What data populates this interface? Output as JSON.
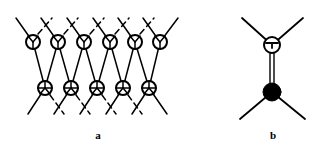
{
  "figure": {
    "background_color": "#ffffff",
    "stroke_color": "#000000",
    "width": 333,
    "height": 149,
    "panels": [
      {
        "id": "panel-a",
        "caption": "a",
        "caption_position": {
          "x": 88,
          "y": 130
        },
        "description": "Lattice of interconnected open-circle vertices and crossed-circle vertices forming a two-row diagram network",
        "top_row": {
          "vertex_type": "open-circle-y-vertex",
          "vertex_fill": "#ffffff",
          "count": 6,
          "radius": 7,
          "y": 42,
          "x_positions": [
            33,
            58,
            84,
            110,
            135,
            160
          ]
        },
        "bottom_row": {
          "vertex_type": "crossed-circle-vertex",
          "vertex_fill": "#ffffff",
          "count": 5,
          "radius": 7,
          "y": 88,
          "x_positions": [
            45,
            71,
            97,
            123,
            149
          ]
        },
        "top_legs": {
          "description": "external legs rising from each top vertex",
          "solid": [
            {
              "x1": 33,
              "y1": 42,
              "x2": 16,
              "y2": 18
            },
            {
              "x1": 58,
              "y1": 42,
              "x2": 41,
              "y2": 18
            },
            {
              "x1": 84,
              "y1": 42,
              "x2": 67,
              "y2": 18
            },
            {
              "x1": 110,
              "y1": 42,
              "x2": 93,
              "y2": 18
            },
            {
              "x1": 135,
              "y1": 42,
              "x2": 118,
              "y2": 18
            },
            {
              "x1": 160,
              "y1": 42,
              "x2": 143,
              "y2": 18
            },
            {
              "x1": 160,
              "y1": 42,
              "x2": 178,
              "y2": 18
            }
          ],
          "dashed": [
            {
              "x1": 38,
              "y1": 34,
              "x2": 52,
              "y2": 18
            },
            {
              "x1": 64,
              "y1": 34,
              "x2": 78,
              "y2": 18
            },
            {
              "x1": 90,
              "y1": 34,
              "x2": 104,
              "y2": 18
            },
            {
              "x1": 115,
              "y1": 34,
              "x2": 129,
              "y2": 18
            },
            {
              "x1": 140,
              "y1": 34,
              "x2": 154,
              "y2": 18
            }
          ]
        },
        "bottom_legs": {
          "description": "external legs descending from each bottom vertex",
          "solid": [
            {
              "x1": 45,
              "y1": 88,
              "x2": 28,
              "y2": 114
            },
            {
              "x1": 71,
              "y1": 88,
              "x2": 54,
              "y2": 114
            },
            {
              "x1": 97,
              "y1": 88,
              "x2": 80,
              "y2": 114
            },
            {
              "x1": 123,
              "y1": 88,
              "x2": 106,
              "y2": 114
            },
            {
              "x1": 149,
              "y1": 88,
              "x2": 132,
              "y2": 114
            },
            {
              "x1": 149,
              "y1": 88,
              "x2": 167,
              "y2": 114
            }
          ],
          "dashed": [
            {
              "x1": 50,
              "y1": 95,
              "x2": 64,
              "y2": 114
            },
            {
              "x1": 76,
              "y1": 95,
              "x2": 90,
              "y2": 114
            },
            {
              "x1": 102,
              "y1": 95,
              "x2": 116,
              "y2": 114
            },
            {
              "x1": 128,
              "y1": 95,
              "x2": 142,
              "y2": 114
            }
          ]
        },
        "interconnects": {
          "description": "zigzag propagator lines linking top row vertices to bottom row vertices",
          "lines": [
            {
              "x1": 33,
              "y1": 42,
              "x2": 45,
              "y2": 88
            },
            {
              "x1": 58,
              "y1": 42,
              "x2": 45,
              "y2": 88
            },
            {
              "x1": 58,
              "y1": 42,
              "x2": 71,
              "y2": 88
            },
            {
              "x1": 84,
              "y1": 42,
              "x2": 71,
              "y2": 88
            },
            {
              "x1": 84,
              "y1": 42,
              "x2": 97,
              "y2": 88
            },
            {
              "x1": 110,
              "y1": 42,
              "x2": 97,
              "y2": 88
            },
            {
              "x1": 110,
              "y1": 42,
              "x2": 123,
              "y2": 88
            },
            {
              "x1": 135,
              "y1": 42,
              "x2": 123,
              "y2": 88
            },
            {
              "x1": 135,
              "y1": 42,
              "x2": 149,
              "y2": 88
            },
            {
              "x1": 160,
              "y1": 42,
              "x2": 149,
              "y2": 88
            }
          ]
        }
      },
      {
        "id": "panel-b",
        "caption": "b",
        "caption_position": {
          "x": 263,
          "y": 130
        },
        "description": "Single interaction diagram: open-circle vertex above, filled-circle vertex below, joined by a double line, each with two external legs",
        "open_vertex": {
          "vertex_type": "open-circle-vertex",
          "fill": "#ffffff",
          "x": 272,
          "y": 45,
          "radius": 8
        },
        "filled_vertex": {
          "vertex_type": "filled-circle-vertex",
          "fill": "#000000",
          "x": 272,
          "y": 92,
          "radius": 9
        },
        "double_line": {
          "description": "two parallel vertical lines connecting the open vertex to the filled vertex",
          "x_offsets": [
            -2,
            2
          ],
          "y_top": 45,
          "y_bottom": 92
        },
        "legs": [
          {
            "name": "upper-left-leg",
            "x1": 272,
            "y1": 45,
            "x2": 242,
            "y2": 18
          },
          {
            "name": "upper-right-leg",
            "x1": 272,
            "y1": 45,
            "x2": 303,
            "y2": 18
          },
          {
            "name": "lower-left-leg",
            "x1": 272,
            "y1": 92,
            "x2": 240,
            "y2": 119
          },
          {
            "name": "lower-right-leg",
            "x1": 272,
            "y1": 92,
            "x2": 305,
            "y2": 119
          }
        ]
      }
    ]
  }
}
